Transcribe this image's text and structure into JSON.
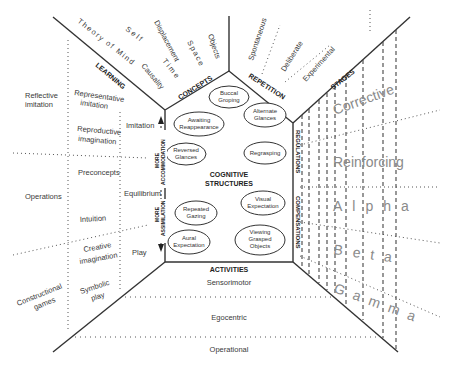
{
  "diagram": {
    "center": {
      "title_line1": "COGNITIVE",
      "title_line2": "STRUCTURES"
    },
    "sections": {
      "concepts": "CONCEPTS",
      "repetition": "REPETITION",
      "learning": "LEARNING",
      "regulations": "REGULATIONS",
      "compensations": "COMPENSATIONS",
      "activities": "ACTIVITIES",
      "stages": "STAGES"
    },
    "clouds": [
      {
        "line1": "Buccal",
        "line2": "Groping"
      },
      {
        "line1": "Alternate",
        "line2": "Glances"
      },
      {
        "line1": "Awaiting",
        "line2": "Reappearance"
      },
      {
        "line1": "Reversed",
        "line2": "Glances"
      },
      {
        "line1": "Regrasping",
        "line2": ""
      },
      {
        "line1": "Repeated",
        "line2": "Gazing"
      },
      {
        "line1": "Visual",
        "line2": "Expectation"
      },
      {
        "line1": "Aural",
        "line2": "Expectation"
      },
      {
        "line1": "Viewing",
        "line2": "Grasped",
        "line3": "Objects"
      }
    ],
    "concepts_items": [
      "Theory of Mind",
      "Self",
      "Causality",
      "Displacement",
      "Time",
      "Space",
      "Objects"
    ],
    "repetition_items": [
      "Spontaneous",
      "Deliberate",
      "Experimental"
    ],
    "learning": {
      "outer": [
        "Reflective imitation",
        "Operations",
        "Constructional games"
      ],
      "outer_lines": {
        "reflective": [
          "Reflective",
          "imitation"
        ],
        "operations": [
          "Operations"
        ],
        "constructional": [
          "Constructional",
          "games"
        ]
      },
      "middle": {
        "representative": [
          "Representative",
          "imitation"
        ],
        "reproductive": [
          "Reproductive",
          "imagination"
        ],
        "preconcepts": [
          "Preconcepts"
        ],
        "intuition": [
          "Intuition"
        ],
        "creative": [
          "Creative",
          "imagination"
        ],
        "symbolic": [
          "Symbolic",
          "play"
        ]
      },
      "inner": [
        "Imitation",
        "Equilibrium",
        "Play"
      ],
      "axis": {
        "more_accommodation": [
          "MORE",
          "ACCOMMODATION"
        ],
        "more_assimilation": [
          "MORE",
          "ASSIMILATION"
        ]
      }
    },
    "regulation_levels": [
      "Corrective",
      "Reinforcing"
    ],
    "compensation_levels": [
      "Alpha",
      "Beta",
      "Gamma"
    ],
    "activity_levels": [
      "Sensorimotor",
      "Egocentric",
      "Operational"
    ]
  }
}
